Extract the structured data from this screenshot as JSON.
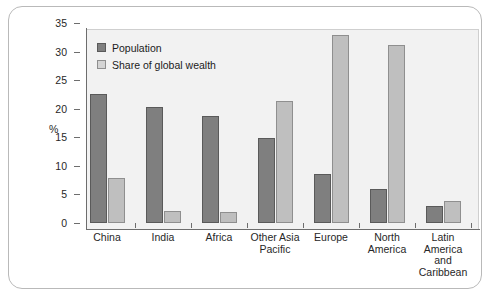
{
  "chart_data": {
    "type": "bar",
    "title": "",
    "subtitle": "",
    "xlabel": "",
    "ylabel": "%",
    "ylim": [
      0,
      35
    ],
    "yticks": [
      0,
      5,
      10,
      15,
      20,
      25,
      30,
      35
    ],
    "ytick_labels": [
      "0",
      "5",
      "10",
      "15",
      "20",
      "25",
      "30",
      "35"
    ],
    "grid": false,
    "legend_position": "top-left",
    "categories": [
      "China",
      "India",
      "Africa",
      "Other Asia\nPacific",
      "Europe",
      "North\nAmerica",
      "Latin\nAmerica\nand\nCaribbean"
    ],
    "series": [
      {
        "name": "Population",
        "color": "#7f7f7f",
        "values": [
          22.5,
          20.3,
          18.7,
          14.8,
          8.6,
          5.9,
          2.9
        ]
      },
      {
        "name": "Share of global wealth",
        "color": "#bfbfbf",
        "values": [
          7.8,
          2.1,
          2.0,
          21.4,
          32.9,
          31.2,
          3.9
        ]
      }
    ]
  },
  "legend": {
    "items": [
      {
        "label": "Population"
      },
      {
        "label": "Share of global wealth"
      }
    ]
  },
  "axes": {
    "y_title": "%"
  }
}
